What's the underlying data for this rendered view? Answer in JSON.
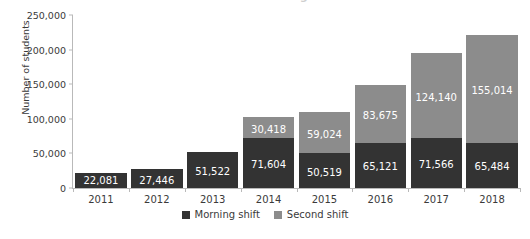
{
  "chart_data": {
    "type": "bar",
    "subtype": "stacked-bar",
    "title": "Number of students in morning and second shifts",
    "xlabel": "",
    "ylabel": "Number of students",
    "categories": [
      "2011",
      "2012",
      "2013",
      "2014",
      "2015",
      "2016",
      "2017",
      "2018"
    ],
    "series": [
      {
        "name": "Morning shift",
        "color": "#333333",
        "values": [
          22081,
          27446,
          51522,
          71604,
          50519,
          65121,
          71566,
          65484
        ],
        "labels": [
          "22,081",
          "27,446",
          "51,522",
          "71,604",
          "50,519",
          "65,121",
          "71,566",
          "65,484"
        ]
      },
      {
        "name": "Second shift",
        "color": "#8c8c8c",
        "values": [
          0,
          0,
          0,
          30418,
          59024,
          83675,
          124140,
          155014
        ],
        "labels": [
          "",
          "",
          "",
          "30,418",
          "59,024",
          "83,675",
          "124,140",
          "155,014"
        ]
      }
    ],
    "totals": [
      22081,
      27446,
      51522,
      102022,
      109543,
      148796,
      195706,
      220498
    ],
    "ylim": [
      0,
      250000
    ],
    "yticks": [
      0,
      50000,
      100000,
      150000,
      200000,
      250000
    ],
    "ytick_labels": [
      "0",
      "50,000",
      "100,000",
      "150,000",
      "200,000",
      "250,000"
    ],
    "grid": false,
    "legend_position": "bottom"
  },
  "legend": {
    "items": [
      {
        "label": "Morning shift",
        "swatch": "morning"
      },
      {
        "label": "Second shift",
        "swatch": "second"
      }
    ]
  }
}
